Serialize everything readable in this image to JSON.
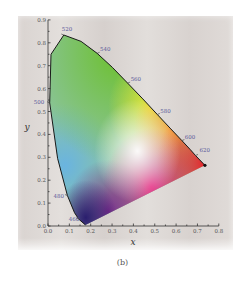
{
  "figure": {
    "caption": "(b)"
  },
  "chart_data": {
    "type": "scatter",
    "subtype": "chromaticity-diagram",
    "xlabel": "x",
    "ylabel": "y",
    "xlim": [
      0.0,
      0.8
    ],
    "ylim": [
      0.0,
      0.9
    ],
    "x_ticks": [
      "0.0",
      "0.1",
      "0.2",
      "0.3",
      "0.4",
      "0.5",
      "0.6",
      "0.7",
      "0.8"
    ],
    "y_ticks": [
      "0.0",
      "0.1",
      "0.2",
      "0.3",
      "0.4",
      "0.5",
      "0.6",
      "0.7",
      "0.8",
      "0.9"
    ],
    "grid": false,
    "wavelength_labels": [
      {
        "label": "460",
        "x": 0.144,
        "y": 0.03
      },
      {
        "label": "480",
        "x": 0.091,
        "y": 0.133
      },
      {
        "label": "500",
        "x": 0.008,
        "y": 0.538
      },
      {
        "label": "520",
        "x": 0.074,
        "y": 0.834
      },
      {
        "label": "540",
        "x": 0.23,
        "y": 0.754
      },
      {
        "label": "560",
        "x": 0.373,
        "y": 0.624
      },
      {
        "label": "580",
        "x": 0.512,
        "y": 0.487
      },
      {
        "label": "600",
        "x": 0.627,
        "y": 0.373
      },
      {
        "label": "620",
        "x": 0.691,
        "y": 0.308
      }
    ],
    "spectral_locus": [
      [
        0.175,
        0.005
      ],
      [
        0.144,
        0.03
      ],
      [
        0.124,
        0.058
      ],
      [
        0.091,
        0.133
      ],
      [
        0.045,
        0.295
      ],
      [
        0.008,
        0.538
      ],
      [
        0.014,
        0.75
      ],
      [
        0.074,
        0.834
      ],
      [
        0.155,
        0.806
      ],
      [
        0.23,
        0.754
      ],
      [
        0.302,
        0.692
      ],
      [
        0.373,
        0.624
      ],
      [
        0.444,
        0.555
      ],
      [
        0.512,
        0.487
      ],
      [
        0.575,
        0.424
      ],
      [
        0.627,
        0.373
      ],
      [
        0.666,
        0.334
      ],
      [
        0.691,
        0.308
      ],
      [
        0.735,
        0.265
      ]
    ]
  }
}
